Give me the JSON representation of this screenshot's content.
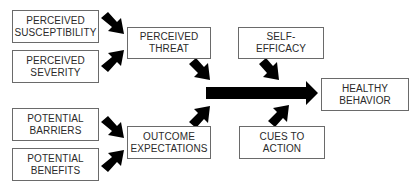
{
  "diagram": {
    "nodes": {
      "perceived_susceptibility": {
        "line1": "PERCEIVED",
        "line2": "SUSCEPTIBILITY"
      },
      "perceived_severity": {
        "line1": "PERCEIVED",
        "line2": "SEVERITY"
      },
      "perceived_threat": {
        "line1": "PERCEIVED",
        "line2": "THREAT"
      },
      "self_efficacy": {
        "line1": "SELF-",
        "line2": "EFFICACY"
      },
      "healthy_behavior": {
        "line1": "HEALTHY",
        "line2": "BEHAVIOR"
      },
      "potential_barriers": {
        "line1": "POTENTIAL",
        "line2": "BARRIERS"
      },
      "potential_benefits": {
        "line1": "POTENTIAL",
        "line2": "BENEFITS"
      },
      "outcome_expectations": {
        "line1": "OUTCOME",
        "line2": "EXPECTATIONS"
      },
      "cues_to_action": {
        "line1": "CUES TO",
        "line2": "ACTION"
      }
    },
    "edges": [
      {
        "from": "perceived_susceptibility",
        "to": "perceived_threat"
      },
      {
        "from": "perceived_severity",
        "to": "perceived_threat"
      },
      {
        "from": "potential_barriers",
        "to": "outcome_expectations"
      },
      {
        "from": "potential_benefits",
        "to": "outcome_expectations"
      },
      {
        "from": "perceived_threat",
        "to": "main_arrow"
      },
      {
        "from": "outcome_expectations",
        "to": "main_arrow"
      },
      {
        "from": "self_efficacy",
        "to": "main_arrow"
      },
      {
        "from": "cues_to_action",
        "to": "main_arrow"
      },
      {
        "from": "main_arrow",
        "to": "healthy_behavior"
      }
    ],
    "colors": {
      "arrow": "#000000",
      "border": "#6a6a6a",
      "text": "#2a2a2a"
    }
  }
}
